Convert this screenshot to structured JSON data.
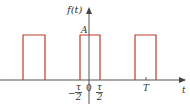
{
  "diagram": {
    "y_axis_label": "f(t)",
    "x_axis_label": "t",
    "amplitude_label": "A",
    "origin_label": "0",
    "period_label": "T",
    "left_edge": {
      "sign": "−",
      "numerator": "τ",
      "denominator": "2"
    },
    "right_edge": {
      "numerator": "τ",
      "denominator": "2"
    },
    "pulse_color": "#c0392b",
    "axis_color": "#555555",
    "pulses": [
      {
        "x_start": 23,
        "x_end": 45
      },
      {
        "x_start": 80,
        "x_end": 100
      },
      {
        "x_start": 135,
        "x_end": 156
      }
    ]
  }
}
